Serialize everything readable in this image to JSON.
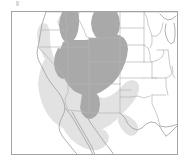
{
  "figure": {
    "kind": "thematic-range-map",
    "title": "",
    "region_label": "Western United States",
    "background_color": "#ffffff",
    "frame": {
      "x": 11,
      "y": 11,
      "width": 167,
      "height": 144,
      "stroke_color": "#9a9a9a",
      "fill_color": "#ffffff",
      "stroke_width": 0.9
    },
    "artifact": {
      "name": "top-left-speck",
      "color": "#bdbdbd",
      "x": 16,
      "y": 1,
      "width": 3,
      "height": 5
    }
  },
  "legend_classes": [
    {
      "name": "core-range",
      "label": "Core range",
      "color": "#a9a9a9",
      "opacity": 1
    },
    {
      "name": "peripheral-range",
      "label": "Peripheral range",
      "color": "#e2e2e2",
      "opacity": 1
    }
  ],
  "map_style": {
    "state_border_color": "#b4b4b4",
    "state_border_width": 0.7,
    "coastline_color": "#a0a0a0",
    "coastline_width": 0.8,
    "core_fill": "#a9a9a9",
    "peripheral_fill": "#e2e2e2",
    "land_fill": "#ffffff"
  },
  "shapes": {
    "peripheral_region": "M 46 92 L 44 99 L 41 106 L 39 113 L 40 120 L 44 126 L 49 132 L 55 137 L 62 141 L 70 143 L 79 144 L 88 143 L 97 140 L 105 135 L 112 129 L 118 123 L 124 117 L 130 112 L 136 108 L 141 104 L 144 99 L 145 93 L 143 88 L 139 85 L 134 84 L 129 86 L 125 90 L 121 95 L 116 99 L 110 101 L 104 101 L 99 98 L 96 93 L 94 87 L 92 81 L 88 77 L 83 75 L 77 76 L 71 79 L 65 83 L 58 87 L 52 90 Z",
    "peripheral_west_arm": "M 46 92 L 42 85 L 39 78 L 37 71 L 36 64 L 36 57 L 37 50 L 39 44 L 42 39 L 46 36 L 50 36 L 53 39 L 54 44 L 53 50 L 51 57 L 50 64 L 50 71 L 51 78 L 52 85 Z",
    "core_region": "M 60 12 L 58 22 L 57 32 L 58 41 L 60 49 L 62 56 L 63 63 L 63 70 L 64 77 L 67 83 L 71 88 L 76 92 L 82 95 L 89 96 L 96 95 L 102 92 L 108 88 L 113 83 L 118 77 L 122 71 L 125 64 L 127 57 L 128 50 L 128 43 L 127 36 L 125 30 L 122 25 L 118 21 L 113 17 L 108 14 L 102 12 L 96 11 L 90 11 L 84 12 L 78 14 L 72 16 L 66 16 L 62 14 Z",
    "core_north_lobe_a": "M 60 12 L 61 18 L 63 24 L 66 28 L 70 30 L 74 29 L 77 26 L 78 21 L 78 15 L 77 11 L 70 11 L 64 11 Z",
    "core_north_lobe_b": "M 95 11 L 93 16 L 92 22 L 93 28 L 96 33 L 101 36 L 107 36 L 112 33 L 115 28 L 116 22 L 115 16 L 113 11 Z",
    "core_south_tail": "M 82 95 L 81 102 L 81 109 L 83 115 L 87 119 L 92 120 L 97 117 L 100 112 L 101 105 L 100 98 L 97 94 Z"
  },
  "states": [
    {
      "name": "washington",
      "shaded": "core-partial"
    },
    {
      "name": "oregon",
      "shaded": "core-partial"
    },
    {
      "name": "idaho",
      "shaded": "core"
    },
    {
      "name": "montana",
      "shaded": "core-partial"
    },
    {
      "name": "wyoming",
      "shaded": "core"
    },
    {
      "name": "nevada",
      "shaded": "core"
    },
    {
      "name": "utah",
      "shaded": "core"
    },
    {
      "name": "colorado",
      "shaded": "core"
    },
    {
      "name": "arizona",
      "shaded": "core"
    },
    {
      "name": "new-mexico",
      "shaded": "core"
    },
    {
      "name": "california",
      "shaded": "peripheral"
    },
    {
      "name": "texas",
      "shaded": "peripheral"
    },
    {
      "name": "oklahoma",
      "shaded": "peripheral"
    },
    {
      "name": "kansas",
      "shaded": "peripheral"
    },
    {
      "name": "nebraska",
      "shaded": "none"
    },
    {
      "name": "south-dakota",
      "shaded": "none"
    },
    {
      "name": "north-dakota",
      "shaded": "none"
    },
    {
      "name": "minnesota",
      "shaded": "none"
    },
    {
      "name": "iowa",
      "shaded": "none"
    },
    {
      "name": "missouri",
      "shaded": "none"
    },
    {
      "name": "arkansas",
      "shaded": "none"
    },
    {
      "name": "louisiana",
      "shaded": "none"
    },
    {
      "name": "wisconsin",
      "shaded": "none"
    },
    {
      "name": "illinois",
      "shaded": "none"
    },
    {
      "name": "mexico",
      "shaded": "peripheral"
    },
    {
      "name": "baja-california",
      "shaded": "peripheral"
    }
  ]
}
